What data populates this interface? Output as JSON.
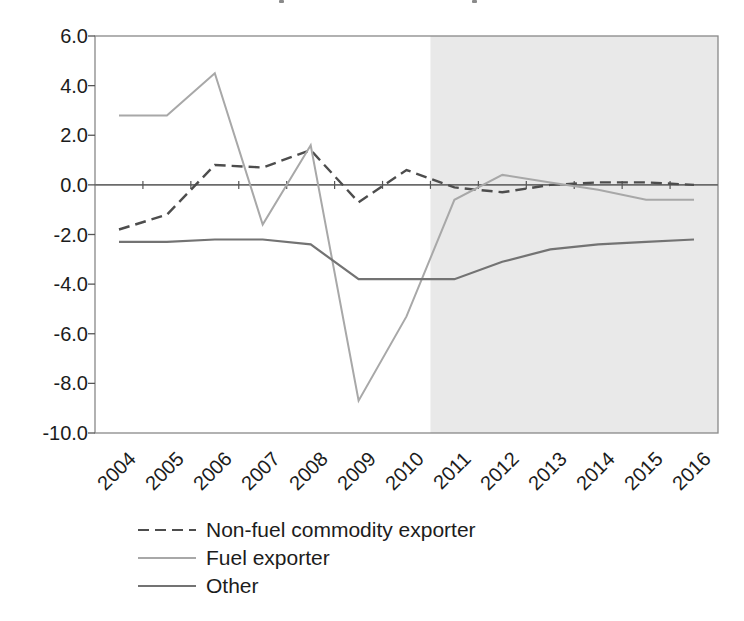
{
  "chart_data": {
    "type": "line",
    "categories": [
      "2004",
      "2005",
      "2006",
      "2007",
      "2008",
      "2009",
      "2010",
      "2011",
      "2012",
      "2013",
      "2014",
      "2015",
      "2016"
    ],
    "series": [
      {
        "name": "Non-fuel commodity exporter",
        "values": [
          -1.8,
          -1.2,
          0.8,
          0.7,
          1.4,
          -0.7,
          0.6,
          -0.1,
          -0.3,
          0.0,
          0.1,
          0.1,
          0.0
        ],
        "color": "#4d4d4d",
        "dash": "11 6",
        "width": 2.4
      },
      {
        "name": "Fuel exporter",
        "values": [
          2.8,
          2.8,
          4.5,
          -1.6,
          1.6,
          -8.7,
          -5.3,
          -0.6,
          0.4,
          0.1,
          -0.2,
          -0.6,
          -0.6
        ],
        "color": "#a8a8a8",
        "dash": "",
        "width": 2.0
      },
      {
        "name": "Other",
        "values": [
          -2.3,
          -2.3,
          -2.2,
          -2.2,
          -2.4,
          -3.8,
          -3.8,
          -3.8,
          -3.1,
          -2.6,
          -2.4,
          -2.3,
          -2.2
        ],
        "color": "#737373",
        "dash": "",
        "width": 2.2
      }
    ],
    "title": "",
    "xlabel": "",
    "ylabel": "",
    "ylim": [
      -10,
      6
    ],
    "ytick_step": 2,
    "ytick_labels": [
      "6.0",
      "4.0",
      "2.0",
      "0.0",
      "-2.0",
      "-4.0",
      "-6.0",
      "-8.0",
      "-10.0"
    ],
    "grid": false,
    "legend_position": "bottom-left",
    "shaded_region": {
      "from_category": "2011",
      "to_category": "2016",
      "color": "#e9e9e9"
    }
  },
  "axis_style": {
    "border_color": "#898989",
    "zero_line_color": "#6b6b6b",
    "tick_color": "#555555",
    "label_color": "#1c1c1c"
  }
}
